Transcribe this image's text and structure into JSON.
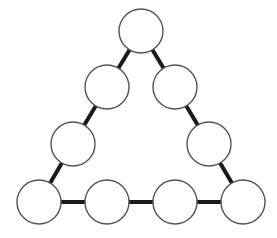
{
  "diagram": {
    "type": "magic-triangle",
    "node_radius": 22,
    "colors": {
      "background": "#ffffff",
      "edge": "#1a1a1a",
      "node_fill": "#ffffff",
      "node_stroke": "#555555"
    },
    "nodes": [
      {
        "id": "top",
        "cx": 141,
        "cy": 31,
        "label": ""
      },
      {
        "id": "left-1",
        "cx": 107,
        "cy": 87,
        "label": ""
      },
      {
        "id": "left-2",
        "cx": 73,
        "cy": 144,
        "label": ""
      },
      {
        "id": "bottom-left",
        "cx": 39,
        "cy": 202,
        "label": ""
      },
      {
        "id": "bottom-2",
        "cx": 107,
        "cy": 202,
        "label": ""
      },
      {
        "id": "bottom-3",
        "cx": 175,
        "cy": 202,
        "label": ""
      },
      {
        "id": "bottom-right",
        "cx": 243,
        "cy": 202,
        "label": ""
      },
      {
        "id": "right-2",
        "cx": 209,
        "cy": 144,
        "label": ""
      },
      {
        "id": "right-1",
        "cx": 175,
        "cy": 87,
        "label": ""
      }
    ],
    "edges": [
      [
        "top",
        "left-1"
      ],
      [
        "left-1",
        "left-2"
      ],
      [
        "left-2",
        "bottom-left"
      ],
      [
        "bottom-left",
        "bottom-2"
      ],
      [
        "bottom-2",
        "bottom-3"
      ],
      [
        "bottom-3",
        "bottom-right"
      ],
      [
        "bottom-right",
        "right-2"
      ],
      [
        "right-2",
        "right-1"
      ],
      [
        "right-1",
        "top"
      ]
    ]
  }
}
